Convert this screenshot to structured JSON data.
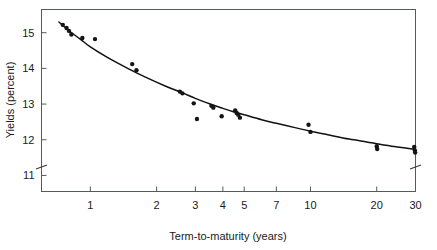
{
  "chart_data": {
    "type": "scatter",
    "title": "",
    "subtitle": "",
    "xlabel": "Term-to-maturity (years)",
    "ylabel": "Yields (percent)",
    "xscale": "log",
    "yscale": "linear",
    "xlim": [
      0.6,
      30
    ],
    "ylim": [
      10.55,
      15.65
    ],
    "grid": false,
    "legend": null,
    "axis_breaks": {
      "y_axis_break_below": 11,
      "note": "break marks drawn on both left and right vertical spines below the 11 tick"
    },
    "xticks": [
      1,
      2,
      3,
      4,
      5,
      7,
      10,
      20,
      30
    ],
    "xtick_labels": [
      "1",
      "2",
      "3",
      "4",
      "5",
      "7",
      "10",
      "20",
      "30"
    ],
    "yticks": [
      11,
      12,
      13,
      14,
      15
    ],
    "ytick_labels": [
      "11",
      "12",
      "13",
      "14",
      "15"
    ],
    "series": [
      {
        "name": "Observed yields",
        "type": "scatter",
        "marker": "filled-circle",
        "color": "#151515",
        "points": [
          {
            "x": 0.75,
            "y": 15.22
          },
          {
            "x": 0.78,
            "y": 15.13
          },
          {
            "x": 0.8,
            "y": 15.05
          },
          {
            "x": 0.82,
            "y": 14.95
          },
          {
            "x": 0.92,
            "y": 14.85
          },
          {
            "x": 1.05,
            "y": 14.82
          },
          {
            "x": 1.55,
            "y": 14.12
          },
          {
            "x": 1.62,
            "y": 13.95
          },
          {
            "x": 2.55,
            "y": 13.35
          },
          {
            "x": 2.62,
            "y": 13.3
          },
          {
            "x": 2.95,
            "y": 13.02
          },
          {
            "x": 3.05,
            "y": 12.58
          },
          {
            "x": 3.55,
            "y": 12.95
          },
          {
            "x": 3.62,
            "y": 12.9
          },
          {
            "x": 3.95,
            "y": 12.66
          },
          {
            "x": 4.55,
            "y": 12.82
          },
          {
            "x": 4.62,
            "y": 12.75
          },
          {
            "x": 4.7,
            "y": 12.7
          },
          {
            "x": 4.78,
            "y": 12.62
          },
          {
            "x": 9.8,
            "y": 12.42
          },
          {
            "x": 10.0,
            "y": 12.22
          },
          {
            "x": 20.0,
            "y": 11.82
          },
          {
            "x": 20.1,
            "y": 11.74
          },
          {
            "x": 29.6,
            "y": 11.8
          },
          {
            "x": 29.8,
            "y": 11.7
          },
          {
            "x": 29.9,
            "y": 11.64
          }
        ]
      },
      {
        "name": "Fitted yield curve",
        "type": "line",
        "color": "#111111",
        "points": [
          {
            "x": 0.72,
            "y": 15.3
          },
          {
            "x": 0.8,
            "y": 15.05
          },
          {
            "x": 0.9,
            "y": 14.82
          },
          {
            "x": 1.0,
            "y": 14.6
          },
          {
            "x": 1.2,
            "y": 14.3
          },
          {
            "x": 1.5,
            "y": 13.98
          },
          {
            "x": 1.8,
            "y": 13.74
          },
          {
            "x": 2.2,
            "y": 13.5
          },
          {
            "x": 2.6,
            "y": 13.32
          },
          {
            "x": 3.0,
            "y": 13.16
          },
          {
            "x": 3.5,
            "y": 13.0
          },
          {
            "x": 4.0,
            "y": 12.88
          },
          {
            "x": 4.5,
            "y": 12.78
          },
          {
            "x": 5.0,
            "y": 12.7
          },
          {
            "x": 6.0,
            "y": 12.56
          },
          {
            "x": 7.0,
            "y": 12.46
          },
          {
            "x": 8.5,
            "y": 12.34
          },
          {
            "x": 10.0,
            "y": 12.24
          },
          {
            "x": 12.0,
            "y": 12.14
          },
          {
            "x": 15.0,
            "y": 12.02
          },
          {
            "x": 18.0,
            "y": 11.94
          },
          {
            "x": 20.0,
            "y": 11.89
          },
          {
            "x": 24.0,
            "y": 11.81
          },
          {
            "x": 27.0,
            "y": 11.77
          },
          {
            "x": 30.0,
            "y": 11.73
          }
        ]
      }
    ]
  },
  "figure": {
    "xlabel": "Term-to-maturity (years)",
    "ylabel": "Yields (percent)"
  }
}
